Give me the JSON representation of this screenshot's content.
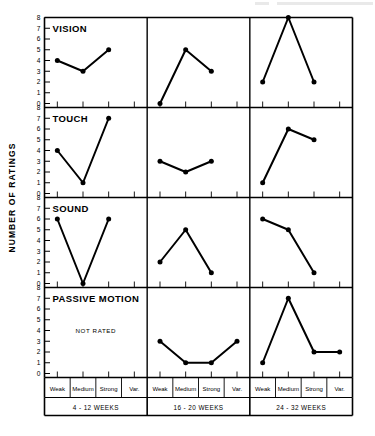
{
  "figure": {
    "y_axis_title": "NUMBER OF RATINGS",
    "not_rated_text": "NOT RATED"
  },
  "chart_data": {
    "type": "line",
    "title": "",
    "xlabel": "",
    "ylabel": "NUMBER OF RATINGS",
    "ylim": [
      0,
      8
    ],
    "yticks": [
      0,
      1,
      2,
      3,
      4,
      5,
      6,
      7,
      8
    ],
    "grid": false,
    "legend": "none",
    "categories": [
      "Weak",
      "Medium",
      "Strong",
      "Var."
    ],
    "group_labels": [
      "4 - 12 WEEKS",
      "16 - 20 WEEKS",
      "24 - 32 WEEKS"
    ],
    "row_labels": [
      "VISION",
      "TOUCH",
      "SOUND",
      "PASSIVE MOTION"
    ],
    "panels": [
      {
        "row": "VISION",
        "groups": [
          {
            "group": "4 - 12 WEEKS",
            "x": [
              "Weak",
              "Medium",
              "Strong"
            ],
            "values": [
              4,
              3,
              5
            ],
            "note": ""
          },
          {
            "group": "16 - 20 WEEKS",
            "x": [
              "Weak",
              "Medium",
              "Strong"
            ],
            "values": [
              0,
              5,
              3
            ],
            "note": ""
          },
          {
            "group": "24 - 32 WEEKS",
            "x": [
              "Weak",
              "Medium",
              "Strong"
            ],
            "values": [
              2,
              8,
              2
            ],
            "note": ""
          }
        ]
      },
      {
        "row": "TOUCH",
        "groups": [
          {
            "group": "4 - 12 WEEKS",
            "x": [
              "Weak",
              "Medium",
              "Strong"
            ],
            "values": [
              4,
              1,
              7
            ],
            "note": ""
          },
          {
            "group": "16 - 20 WEEKS",
            "x": [
              "Weak",
              "Medium",
              "Strong"
            ],
            "values": [
              3,
              2,
              3
            ],
            "note": ""
          },
          {
            "group": "24 - 32 WEEKS",
            "x": [
              "Weak",
              "Medium",
              "Strong"
            ],
            "values": [
              1,
              6,
              5
            ],
            "note": ""
          }
        ]
      },
      {
        "row": "SOUND",
        "groups": [
          {
            "group": "4 - 12 WEEKS",
            "x": [
              "Weak",
              "Medium",
              "Strong"
            ],
            "values": [
              6,
              0,
              6
            ],
            "note": ""
          },
          {
            "group": "16 - 20 WEEKS",
            "x": [
              "Weak",
              "Medium",
              "Strong"
            ],
            "values": [
              2,
              5,
              1
            ],
            "note": ""
          },
          {
            "group": "24 - 32 WEEKS",
            "x": [
              "Weak",
              "Medium",
              "Strong"
            ],
            "values": [
              6,
              5,
              1
            ],
            "note": ""
          }
        ]
      },
      {
        "row": "PASSIVE MOTION",
        "groups": [
          {
            "group": "4 - 12 WEEKS",
            "x": [],
            "values": [],
            "note": "NOT RATED"
          },
          {
            "group": "16 - 20 WEEKS",
            "x": [
              "Weak",
              "Medium",
              "Strong",
              "Var."
            ],
            "values": [
              3,
              1,
              1,
              3
            ],
            "note": ""
          },
          {
            "group": "24 - 32 WEEKS",
            "x": [
              "Weak",
              "Medium",
              "Strong",
              "Var."
            ],
            "values": [
              1,
              7,
              2,
              2
            ],
            "note": ""
          }
        ]
      }
    ]
  }
}
